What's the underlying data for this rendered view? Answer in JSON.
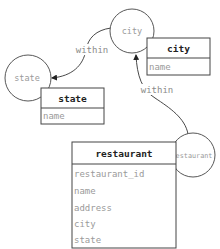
{
  "diagram": {
    "type": "entity-relationship",
    "nodes": [
      {
        "id": "city",
        "circle_label": "city"
      },
      {
        "id": "state",
        "circle_label": "state"
      },
      {
        "id": "restaurant",
        "circle_label": "restaurant"
      }
    ],
    "tables": {
      "city": {
        "title": "city",
        "fields": [
          "name"
        ]
      },
      "state": {
        "title": "state",
        "fields": [
          "name"
        ]
      },
      "restaurant": {
        "title": "restaurant",
        "fields": [
          "restaurant_id",
          "name",
          "address",
          "city",
          "state"
        ]
      }
    },
    "edges": [
      {
        "from": "city",
        "to": "state",
        "label": "within"
      },
      {
        "from": "restaurant",
        "to": "city",
        "label": "within"
      }
    ]
  },
  "colors": {
    "stroke": "#444444",
    "title_text": "#222222",
    "muted_text": "#9a9a9a"
  }
}
